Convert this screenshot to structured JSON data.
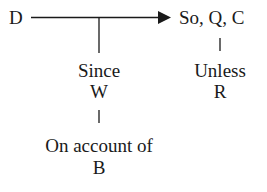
{
  "diagram": {
    "type": "Toulmin argument model",
    "nodes": {
      "data": {
        "label": "D"
      },
      "claim": {
        "label": "So, Q, C"
      },
      "warrant": {
        "connector": "Since",
        "label": "W"
      },
      "rebuttal": {
        "connector": "Unless",
        "label": "R"
      },
      "backing": {
        "connector": "On account of",
        "label": "B"
      }
    },
    "edges": [
      {
        "from": "D",
        "to": "So, Q, C",
        "style": "arrow"
      },
      {
        "from": "D→C line",
        "to": "Since W",
        "style": "line"
      },
      {
        "from": "So, Q, C",
        "to": "Unless R",
        "style": "line"
      },
      {
        "from": "Since W",
        "to": "On account of B",
        "style": "line"
      }
    ],
    "colors": {
      "ink": "#1a1a1a",
      "background": "#ffffff"
    }
  }
}
